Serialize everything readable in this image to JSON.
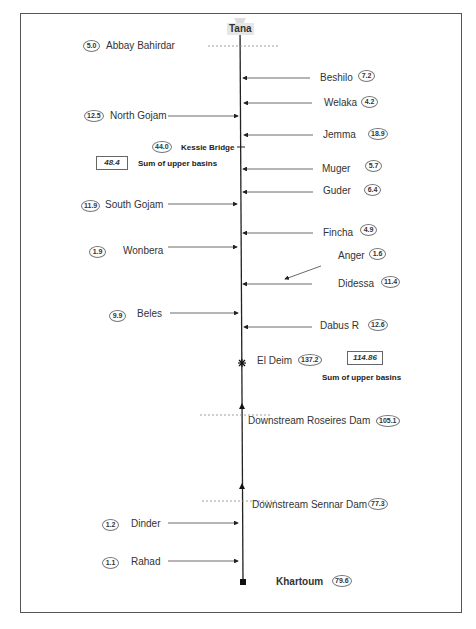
{
  "diagram": {
    "title": "Tana",
    "outlet": {
      "label": "Khartoum",
      "value": "79.6"
    },
    "stations": [
      {
        "name": "Abbay Bahirdar",
        "value": "5.0",
        "side": "left"
      },
      {
        "name": "Kessie Bridge",
        "value": "44.0",
        "side": "left"
      },
      {
        "name": "El Deim",
        "value": "137.2",
        "side": "right"
      },
      {
        "name": "Downstream Roseires Dam",
        "value": "105.1",
        "side": "right"
      },
      {
        "name": "Downstream Sennar Dam",
        "value": "77.3",
        "side": "right"
      }
    ],
    "tributaries_right": [
      {
        "name": "Beshilo",
        "value": "7.2"
      },
      {
        "name": "Welaka",
        "value": "4.2"
      },
      {
        "name": "Jemma",
        "value": "18.9"
      },
      {
        "name": "Muger",
        "value": "5.7"
      },
      {
        "name": "Guder",
        "value": "6.4"
      },
      {
        "name": "Fincha",
        "value": "4.9"
      },
      {
        "name": "Anger",
        "value": "1.6"
      },
      {
        "name": "Didessa",
        "value": "11.4"
      },
      {
        "name": "Dabus R",
        "value": "12.6"
      }
    ],
    "tributaries_left": [
      {
        "name": "North Gojam",
        "value": "12.5"
      },
      {
        "name": "South Gojam",
        "value": "11.9"
      },
      {
        "name": "Wonbera",
        "value": "1.9"
      },
      {
        "name": "Beles",
        "value": "9.9"
      },
      {
        "name": "Dinder",
        "value": "1.2"
      },
      {
        "name": "Rahad",
        "value": "1.1"
      }
    ],
    "sums": [
      {
        "value": "48.4",
        "label": "Sum of upper basins"
      },
      {
        "value": "114.86",
        "label": "Sum of upper basins"
      }
    ]
  }
}
